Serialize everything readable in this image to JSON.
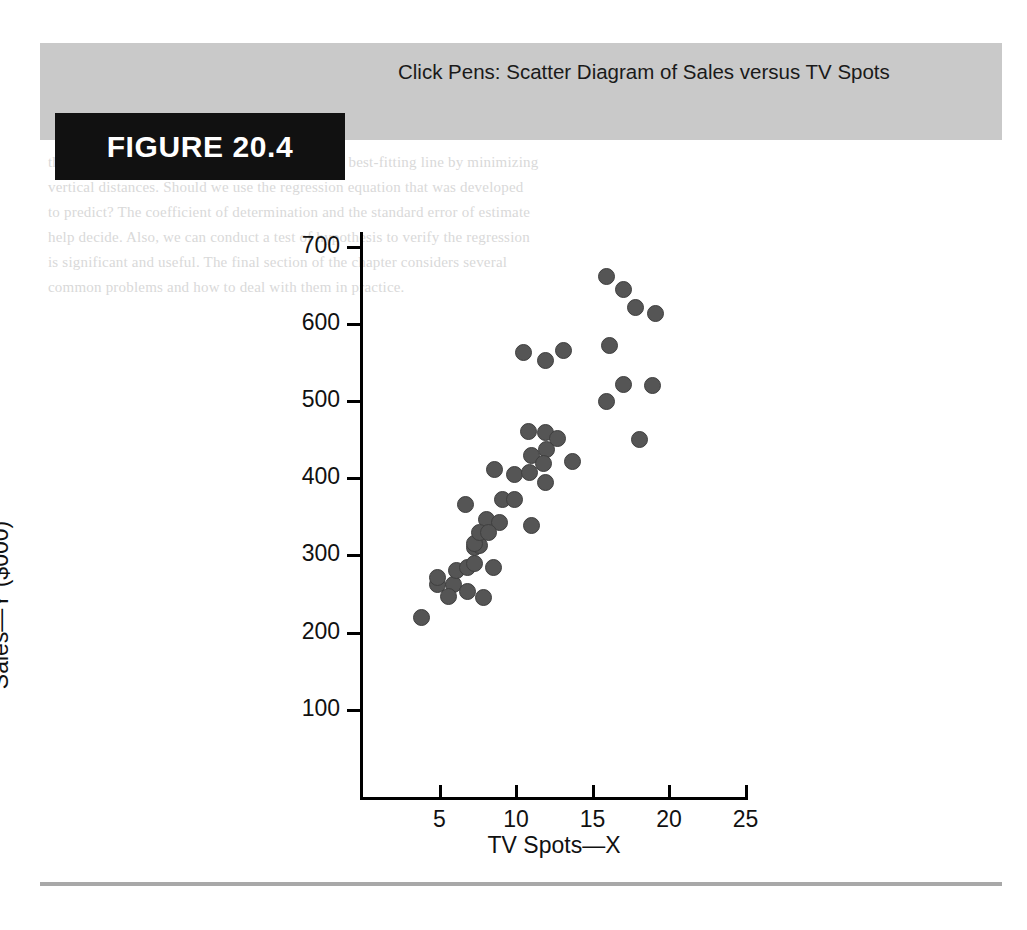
{
  "figure": {
    "badge_label": "FIGURE 20.4",
    "caption": "Click Pens: Scatter Diagram of Sales versus TV Spots"
  },
  "colors": {
    "header_band": "#c9c9c9",
    "badge_background": "#111111",
    "badge_text": "#ffffff",
    "dot_fill": "#555555",
    "dot_stroke": "#3f3f3f",
    "axis": "#000000",
    "bottom_rule": "#a8a8a8"
  },
  "background_text": {
    "lines": [
      "the least squares method. This method gives the best-fitting line by minimizing",
      "vertical distances. Should we use the regression equation that was developed",
      "to predict? The coefficient of determination and the standard error of estimate",
      "help decide. Also, we can conduct a test of hypothesis to verify the regression",
      "is significant and useful. The final section of the chapter considers several",
      "common problems and how to deal with them in practice."
    ]
  },
  "chart_data": {
    "type": "scatter",
    "title": "Click Pens: Scatter Diagram of Sales versus TV Spots",
    "xlabel": "TV Spots—X",
    "ylabel": "Sales—Y ($000)",
    "xlim": [
      0,
      25
    ],
    "ylim": [
      0,
      730
    ],
    "xticks": [
      5,
      10,
      15,
      20,
      25
    ],
    "yticks": [
      100,
      200,
      300,
      400,
      500,
      600,
      700
    ],
    "grid": false,
    "legend": "none",
    "marker": {
      "shape": "circle",
      "color": "#555555",
      "size_px": 17
    },
    "points": [
      {
        "x": 3.8,
        "y": 219
      },
      {
        "x": 4.9,
        "y": 262
      },
      {
        "x": 4.9,
        "y": 272
      },
      {
        "x": 5.9,
        "y": 262
      },
      {
        "x": 5.6,
        "y": 247
      },
      {
        "x": 6.8,
        "y": 253
      },
      {
        "x": 6.1,
        "y": 281
      },
      {
        "x": 6.8,
        "y": 284
      },
      {
        "x": 7.3,
        "y": 290
      },
      {
        "x": 6.7,
        "y": 366
      },
      {
        "x": 7.3,
        "y": 311
      },
      {
        "x": 7.6,
        "y": 313
      },
      {
        "x": 7.3,
        "y": 316
      },
      {
        "x": 7.9,
        "y": 245
      },
      {
        "x": 8.5,
        "y": 285
      },
      {
        "x": 8.1,
        "y": 346
      },
      {
        "x": 8.9,
        "y": 343
      },
      {
        "x": 7.6,
        "y": 330
      },
      {
        "x": 8.2,
        "y": 330
      },
      {
        "x": 9.1,
        "y": 373
      },
      {
        "x": 8.6,
        "y": 411
      },
      {
        "x": 9.9,
        "y": 373
      },
      {
        "x": 9.9,
        "y": 405
      },
      {
        "x": 10.8,
        "y": 461
      },
      {
        "x": 11.9,
        "y": 459
      },
      {
        "x": 10.5,
        "y": 563
      },
      {
        "x": 11.9,
        "y": 553
      },
      {
        "x": 13.1,
        "y": 566
      },
      {
        "x": 11.0,
        "y": 430
      },
      {
        "x": 12.0,
        "y": 437
      },
      {
        "x": 11.8,
        "y": 419
      },
      {
        "x": 10.9,
        "y": 407
      },
      {
        "x": 11.9,
        "y": 394
      },
      {
        "x": 12.7,
        "y": 451
      },
      {
        "x": 11.0,
        "y": 339
      },
      {
        "x": 13.7,
        "y": 422
      },
      {
        "x": 15.9,
        "y": 661
      },
      {
        "x": 17.0,
        "y": 645
      },
      {
        "x": 17.8,
        "y": 622
      },
      {
        "x": 19.1,
        "y": 614
      },
      {
        "x": 16.1,
        "y": 572
      },
      {
        "x": 17.0,
        "y": 522
      },
      {
        "x": 18.9,
        "y": 520
      },
      {
        "x": 15.9,
        "y": 499
      },
      {
        "x": 18.1,
        "y": 450
      }
    ]
  },
  "axis_titles": {
    "x": "TV Spots—X",
    "y": "Sales—Y ($000)"
  }
}
